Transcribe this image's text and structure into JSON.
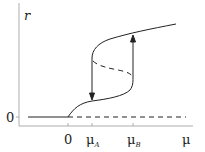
{
  "diagram": {
    "type": "bifurcation-diagram",
    "y_axis_label": "r",
    "x_axis_label": "μ",
    "y_tick_label": "0",
    "x_ticks": [
      {
        "label": "0",
        "sub": ""
      },
      {
        "label": "μ",
        "sub": "A"
      },
      {
        "label": "μ",
        "sub": "B"
      }
    ],
    "branches": [
      {
        "name": "trivial-stable",
        "style": "solid",
        "range": "μ < 0"
      },
      {
        "name": "trivial-unstable",
        "style": "dashed",
        "range": "μ > 0"
      },
      {
        "name": "lower-stable",
        "style": "solid",
        "range": "0 < μ < μB"
      },
      {
        "name": "middle-unstable",
        "style": "dashed",
        "range": "μA < μ < μB"
      },
      {
        "name": "upper-stable",
        "style": "solid",
        "range": "μ > μA"
      }
    ],
    "jumps": [
      {
        "at": "μA",
        "direction": "down"
      },
      {
        "at": "μB",
        "direction": "up"
      }
    ],
    "colors": {
      "line": "#222222",
      "axis": "#888888"
    }
  }
}
